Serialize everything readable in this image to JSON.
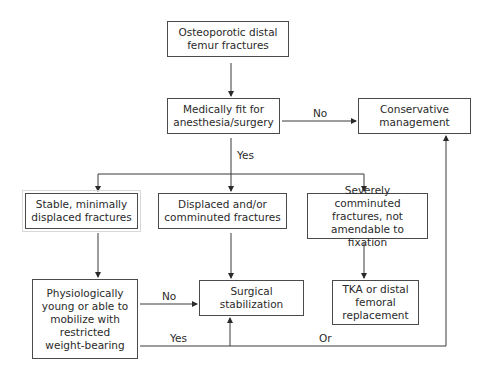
{
  "nodes": {
    "start": {
      "text": "Osteoporotic distal femur fractures"
    },
    "fit": {
      "text": "Medically fit for anesthesia/surgery"
    },
    "conservative": {
      "text": "Conservative management"
    },
    "stable": {
      "text": "Stable, minimally displaced fractures"
    },
    "displaced": {
      "text": "Displaced and/or comminuted fractures"
    },
    "severe": {
      "text": "Severely comminuted fractures, not amendable to fixation"
    },
    "physio": {
      "text": "Physiologically young or able to mobilize with restricted weight-bearing"
    },
    "surgical": {
      "text": "Surgical stabilization"
    },
    "tka": {
      "text": "TKA or distal femoral replacement"
    }
  },
  "edges": {
    "fit_no": "No",
    "fit_yes": "Yes",
    "physio_no": "No",
    "physio_yes": "Yes",
    "physio_or": "Or"
  }
}
